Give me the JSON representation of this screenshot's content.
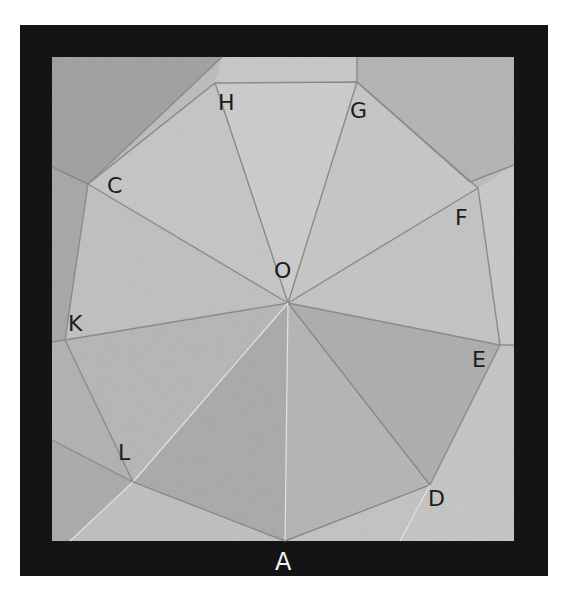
{
  "figure": {
    "frame": {
      "outer": [
        20,
        25,
        548,
        576
      ],
      "inner": [
        52,
        57,
        514,
        541
      ],
      "frame_color": "#141414"
    },
    "paper_color": "#bdbdbd",
    "center": {
      "name": "O",
      "x": 288,
      "y": 303
    },
    "vertices": [
      {
        "name": "A",
        "x": 285,
        "y": 541
      },
      {
        "name": "D",
        "x": 430,
        "y": 485
      },
      {
        "name": "E",
        "x": 500,
        "y": 345
      },
      {
        "name": "F",
        "x": 478,
        "y": 188
      },
      {
        "name": "G",
        "x": 357,
        "y": 82
      },
      {
        "name": "H",
        "x": 215,
        "y": 83
      },
      {
        "name": "C",
        "x": 88,
        "y": 184
      },
      {
        "name": "K",
        "x": 65,
        "y": 340
      },
      {
        "name": "L",
        "x": 133,
        "y": 482
      }
    ],
    "labels": {
      "A": "A",
      "C": "C",
      "D": "D",
      "E": "E",
      "F": "F",
      "G": "G",
      "H": "H",
      "K": "K",
      "L": "L",
      "O": "O"
    }
  }
}
